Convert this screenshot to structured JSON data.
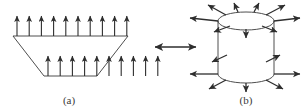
{
  "figure": {
    "type": "physics-diagram",
    "background_color": "#ffffff",
    "stroke_color": "#3a3a3a",
    "arrow_color": "#2e2e2e",
    "label_color": "#3a3a3a",
    "panels": [
      {
        "id": "a",
        "label": "(a)",
        "label_x": 69,
        "label_y": 104,
        "shape": "parallelogram",
        "shape_points": "44,76 13,36 128,36 97,76",
        "arrow_rows": [
          {
            "name": "top-edge-arrows",
            "count": 10,
            "direction": "up",
            "y_base": 36,
            "y_tip": 16,
            "x_start": 17,
            "x_step": 12.2
          },
          {
            "name": "bottom-edge-arrows",
            "count": 10,
            "direction": "up",
            "y_base": 76,
            "y_tip": 56,
            "x_start": 48,
            "x_step": 12.2
          }
        ]
      },
      {
        "id": "connector",
        "label": "",
        "shape": "double-headed-arrow",
        "x1": 155,
        "x2": 196,
        "y": 47
      },
      {
        "id": "b",
        "label": "(b)",
        "label_x": 246,
        "label_y": 104,
        "shape": "cylinder",
        "cx": 246,
        "top_cy": 21,
        "bottom_cy": 74,
        "rx": 28,
        "ry": 9,
        "radiating_arrows": [
          {
            "name": "top-left-diagonal",
            "x1": 226,
            "y1": 15,
            "x2": 208,
            "y2": 5
          },
          {
            "name": "top-up-left",
            "x1": 238,
            "y1": 12,
            "x2": 234,
            "y2": 3
          },
          {
            "name": "top-up-right",
            "x1": 254,
            "y1": 12,
            "x2": 259,
            "y2": 3
          },
          {
            "name": "top-right-diagonal",
            "x1": 266,
            "y1": 15,
            "x2": 285,
            "y2": 5
          },
          {
            "name": "top-left-horizontal",
            "x1": 218,
            "y1": 21,
            "x2": 190,
            "y2": 18
          },
          {
            "name": "top-right-horizontal",
            "x1": 274,
            "y1": 21,
            "x2": 300,
            "y2": 18
          },
          {
            "name": "top-inner-left",
            "x1": 230,
            "y1": 26,
            "x2": 214,
            "y2": 32
          },
          {
            "name": "top-inner-down",
            "x1": 246,
            "y1": 29,
            "x2": 246,
            "y2": 38
          },
          {
            "name": "top-inner-right",
            "x1": 262,
            "y1": 26,
            "x2": 277,
            "y2": 32
          },
          {
            "name": "mid-left-inner",
            "x1": 227,
            "y1": 55,
            "x2": 212,
            "y2": 62
          },
          {
            "name": "mid-right-inner",
            "x1": 266,
            "y1": 62,
            "x2": 280,
            "y2": 55
          },
          {
            "name": "bottom-left-horizontal",
            "x1": 218,
            "y1": 74,
            "x2": 190,
            "y2": 74
          },
          {
            "name": "bottom-right-horizontal",
            "x1": 274,
            "y1": 74,
            "x2": 300,
            "y2": 74
          },
          {
            "name": "bottom-left-diagonal",
            "x1": 226,
            "y1": 80,
            "x2": 209,
            "y2": 89
          },
          {
            "name": "bottom-down",
            "x1": 246,
            "y1": 83,
            "x2": 246,
            "y2": 92
          },
          {
            "name": "bottom-right-diagonal",
            "x1": 266,
            "y1": 80,
            "x2": 283,
            "y2": 89
          }
        ]
      }
    ]
  }
}
